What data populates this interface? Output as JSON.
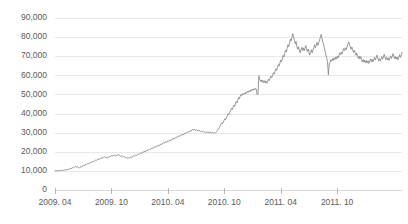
{
  "chart_data": {
    "type": "line",
    "title": "",
    "subtitle": "",
    "xlabel": "",
    "ylabel": "",
    "ylim": [
      0,
      90000
    ],
    "y_ticks": [
      0,
      10000,
      20000,
      30000,
      40000,
      50000,
      60000,
      70000,
      80000,
      90000
    ],
    "y_tick_labels": [
      "0",
      "10,000",
      "20,000",
      "30,000",
      "40,000",
      "50,000",
      "60,000",
      "70,000",
      "80,000",
      "90,000"
    ],
    "x_ticks": [
      "2009. 04",
      "2009. 10",
      "2010. 04",
      "2010. 10",
      "2011. 04",
      "2011. 10"
    ],
    "x_tick_labels": [
      "2009. 04",
      "2009. 10",
      "2010. 04",
      "2010. 10",
      "2011. 04",
      "2011. 10"
    ],
    "xlim": [
      "2009. 04",
      "2012. 02"
    ],
    "grid": true,
    "grid_axis": "y",
    "legend": false,
    "legend_position": "none",
    "line_color": "#8a8a8a",
    "grid_color": "#e8e8e8",
    "axis_color": "#d8d8d8",
    "text_color": "#5a5a5a",
    "background_color": "#ffffff",
    "annotations": [],
    "series": [
      {
        "name": "price",
        "color": "#8a8a8a",
        "values": [
          10050,
          10080,
          10020,
          10120,
          10060,
          10180,
          10100,
          10250,
          10150,
          10320,
          10400,
          10280,
          10500,
          10620,
          10480,
          10750,
          10900,
          10700,
          11050,
          11300,
          11150,
          11500,
          11800,
          11600,
          12000,
          12350,
          12100,
          11900,
          12200,
          11700,
          11450,
          11900,
          12300,
          12050,
          12600,
          12900,
          12700,
          13100,
          13450,
          13200,
          13600,
          13950,
          13700,
          14100,
          14500,
          14250,
          14700,
          15050,
          14800,
          15200,
          15600,
          15350,
          15800,
          16200,
          15950,
          16400,
          16150,
          16600,
          16900,
          16650,
          17100,
          17400,
          17150,
          16800,
          17000,
          16700,
          17200,
          17500,
          17250,
          17700,
          18000,
          17750,
          18200,
          17900,
          18400,
          18100,
          17800,
          18300,
          18600,
          18350,
          18000,
          17600,
          17900,
          17500,
          17200,
          17600,
          17300,
          16900,
          17200,
          16800,
          16500,
          16900,
          16600,
          17000,
          17400,
          17100,
          17600,
          17900,
          17600,
          18100,
          18400,
          18100,
          18600,
          18900,
          18600,
          19100,
          19400,
          19100,
          19700,
          20000,
          19700,
          20300,
          20000,
          20600,
          20900,
          20600,
          21100,
          21400,
          21100,
          21700,
          22000,
          21700,
          22300,
          22600,
          22300,
          22900,
          23200,
          22900,
          23500,
          23200,
          23800,
          24100,
          23800,
          24400,
          24700,
          24400,
          25000,
          25300,
          25000,
          25600,
          25300,
          25900,
          26200,
          25900,
          26500,
          26800,
          26500,
          27100,
          26800,
          27400,
          27700,
          27400,
          28000,
          28300,
          28000,
          28600,
          28900,
          28600,
          29200,
          28900,
          29500,
          29800,
          29500,
          30100,
          30400,
          30100,
          30700,
          31000,
          30700,
          31300,
          31600,
          31300,
          31900,
          31500,
          31100,
          31600,
          31200,
          30800,
          31300,
          30900,
          30500,
          31000,
          30600,
          30200,
          30700,
          30300,
          29900,
          30400,
          30000,
          30500,
          30200,
          29800,
          30300,
          29900,
          30400,
          30000,
          29600,
          30100,
          29700,
          30200,
          30600,
          31200,
          31900,
          32600,
          33400,
          34200,
          35100,
          34600,
          35500,
          36400,
          37300,
          36800,
          37800,
          38800,
          39900,
          39300,
          40400,
          41500,
          42700,
          42000,
          43200,
          44400,
          43700,
          45000,
          46300,
          45600,
          47000,
          48400,
          47700,
          49100,
          50000,
          49400,
          50400,
          49800,
          50800,
          50200,
          51200,
          50600,
          51600,
          51000,
          52000,
          51400,
          52400,
          51800,
          52800,
          52200,
          53000,
          52400,
          53200,
          52600,
          49800,
          50600,
          59800,
          58200,
          56800,
          57600,
          56400,
          57400,
          56200,
          57200,
          56000,
          57000,
          55900,
          56900,
          58000,
          57200,
          58400,
          59600,
          58800,
          60100,
          61400,
          60600,
          62000,
          63400,
          62600,
          64100,
          65600,
          64800,
          66400,
          68000,
          67100,
          68800,
          70500,
          69600,
          71400,
          73200,
          72200,
          74100,
          76000,
          75000,
          77000,
          79000,
          78000,
          80100,
          81800,
          80000,
          78200,
          76500,
          77800,
          75200,
          73600,
          75000,
          73400,
          71800,
          73200,
          74600,
          73000,
          74400,
          72800,
          74200,
          75600,
          74000,
          72400,
          73800,
          72200,
          70600,
          72000,
          73400,
          71800,
          73200,
          74600,
          76000,
          74400,
          75800,
          77200,
          75600,
          77000,
          78400,
          79800,
          81400,
          79600,
          77800,
          76000,
          74200,
          72400,
          70600,
          68800,
          67000,
          60200,
          65400,
          66800,
          68200,
          67400,
          68800,
          67800,
          69200,
          68200,
          69600,
          68600,
          70000,
          69000,
          70400,
          71800,
          70800,
          72200,
          71200,
          72600,
          74000,
          73000,
          74400,
          73400,
          74800,
          76200,
          77600,
          76400,
          75000,
          73600,
          74800,
          73400,
          72000,
          73200,
          71800,
          70400,
          71600,
          70200,
          68800,
          70000,
          68600,
          69800,
          68400,
          67000,
          68200,
          66800,
          68000,
          66600,
          67800,
          66400,
          67600,
          66200,
          67400,
          68600,
          67200,
          68400,
          67000,
          68200,
          69400,
          68000,
          69200,
          70600,
          69000,
          67600,
          68800,
          67400,
          68600,
          69800,
          68400,
          69600,
          71000,
          69600,
          68200,
          69400,
          68000,
          69200,
          67800,
          69000,
          70200,
          68800,
          70000,
          71400,
          70000,
          68600,
          69800,
          68400,
          69600,
          68200,
          69400,
          70800,
          69400,
          70600,
          72000
        ]
      }
    ]
  }
}
